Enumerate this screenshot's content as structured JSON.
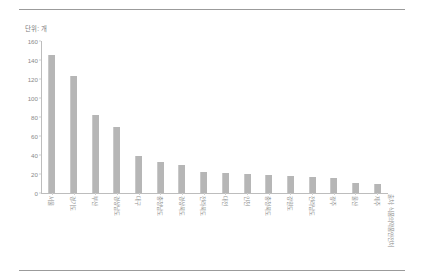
{
  "figure": {
    "unit_label": "단위: 개",
    "source_note": "출처: 식품의약품안전처"
  },
  "chart_data": {
    "type": "bar",
    "title": "",
    "subtitle": "",
    "xlabel": "",
    "ylabel": "단위: 개",
    "ylim": [
      0,
      160
    ],
    "yticks": [
      0,
      20,
      40,
      60,
      80,
      100,
      120,
      140,
      160
    ],
    "grid": false,
    "legend": "none",
    "bar_color": "#b6b6b6",
    "categories": [
      "서울",
      "경기도",
      "부산",
      "경상남도",
      "대구",
      "충청남도",
      "경상북도",
      "전라북도",
      "대전",
      "인천",
      "충청북도",
      "강원도",
      "전라남도",
      "광주",
      "울산",
      "제주"
    ],
    "values": [
      145,
      123,
      82,
      70,
      39,
      33,
      29,
      22,
      21,
      20,
      19,
      18,
      17,
      16,
      11,
      9
    ]
  }
}
